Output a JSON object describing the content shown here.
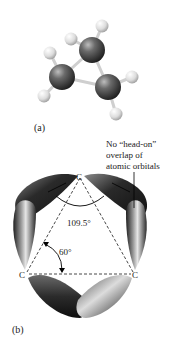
{
  "figure": {
    "panel_a": {
      "label": "(a)",
      "description": "Ball-and-stick model of cyclopropane",
      "atoms": {
        "carbon_count": 3,
        "hydrogen_count": 6
      }
    },
    "panel_b": {
      "label": "(b)",
      "atom_labels": [
        "C",
        "C",
        "C"
      ],
      "angle_orbital": "109.5°",
      "angle_ring": "60°",
      "annotation": [
        "No “head-on”",
        "overlap of",
        "atomic orbitals"
      ]
    }
  }
}
